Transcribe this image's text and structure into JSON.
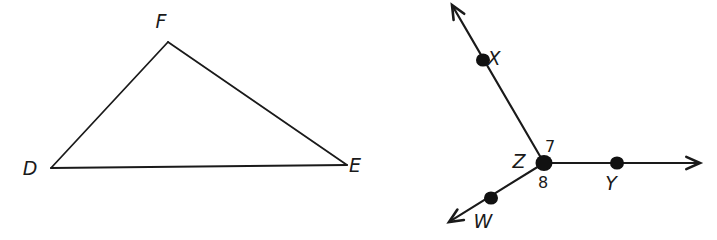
{
  "figure": {
    "background_color": "#ffffff",
    "ink_color": "#1a1a1a"
  },
  "figures": [
    {
      "id": "triangle-def",
      "name": "triangle-def",
      "type": "triangle",
      "vertices": [
        {
          "label": "D",
          "x": 51,
          "y": 168,
          "label_x": 30,
          "label_y": 175
        },
        {
          "label": "E",
          "x": 347,
          "y": 165,
          "label_x": 355,
          "label_y": 172
        },
        {
          "label": "F",
          "x": 168,
          "y": 42,
          "label_x": 161,
          "label_y": 28
        }
      ],
      "sides": [
        {
          "name": "side-DF",
          "from": "D",
          "to": "F"
        },
        {
          "name": "side-FE",
          "from": "F",
          "to": "E"
        },
        {
          "name": "side-DE",
          "from": "D",
          "to": "E"
        }
      ]
    },
    {
      "id": "rays-from-z",
      "name": "rays-from-z",
      "type": "rays",
      "vertex": {
        "label": "Z",
        "x": 544,
        "y": 163,
        "label_x": 519,
        "label_y": 168
      },
      "rays": [
        {
          "name": "ray-ZX",
          "through_point": "X",
          "tip_x": 452,
          "tip_y": 5,
          "point": {
            "label": "X",
            "x": 483,
            "y": 60,
            "label_x": 494,
            "label_y": 65
          }
        },
        {
          "name": "ray-ZY",
          "through_point": "Y",
          "tip_x": 700,
          "tip_y": 163,
          "point": {
            "label": "Y",
            "x": 617,
            "y": 163,
            "label_x": 611,
            "label_y": 190
          }
        },
        {
          "name": "ray-ZW",
          "through_point": "W",
          "tip_x": 449,
          "tip_y": 222,
          "point": {
            "label": "W",
            "x": 491,
            "y": 198,
            "label_x": 483,
            "label_y": 228
          }
        }
      ],
      "angles": [
        {
          "name": "angle-7",
          "label": "7",
          "x": 550,
          "y": 152,
          "between": "ray-ZX and ray-ZY"
        },
        {
          "name": "angle-8",
          "label": "8",
          "x": 543,
          "y": 188,
          "between": "ray-ZY and ray-ZW"
        }
      ]
    }
  ]
}
